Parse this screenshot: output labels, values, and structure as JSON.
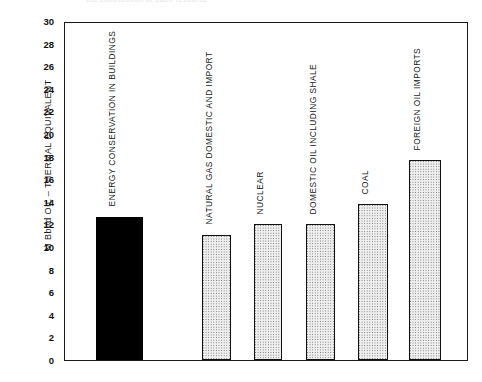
{
  "top_caption": "the contribution of each resource",
  "chart_data": {
    "type": "bar",
    "title": "",
    "subtitle": "",
    "xlabel": "",
    "ylabel": "M Bbl/d OIL – THERMAL EQUIVALENT",
    "ylim": [
      0,
      30
    ],
    "ytick_step": 2,
    "yticks": [
      30,
      28,
      26,
      24,
      22,
      20,
      18,
      16,
      14,
      12,
      10,
      8,
      6,
      4,
      2,
      0
    ],
    "grid": false,
    "legend": "none",
    "categories": [
      "ENERGY CONSERVATION IN BUILDINGS",
      "NATURAL GAS DOMESTIC AND IMPORT",
      "NUCLEAR",
      "DOMESTIC OIL INCLUDING SHALE",
      "COAL",
      "FOREIGN OIL IMPORTS"
    ],
    "values": [
      12.7,
      11.1,
      12.0,
      12.0,
      13.8,
      17.7
    ],
    "bars": [
      {
        "label": "ENERGY CONSERVATION IN BUILDINGS",
        "value": 12.7,
        "fill": "solid",
        "color": "#000000"
      },
      {
        "label": "NATURAL GAS DOMESTIC AND IMPORT",
        "value": 11.1,
        "fill": "dotted",
        "color": "#eeeeee"
      },
      {
        "label": "NUCLEAR",
        "value": 12.0,
        "fill": "dotted",
        "color": "#eeeeee"
      },
      {
        "label": "DOMESTIC OIL INCLUDING SHALE",
        "value": 12.0,
        "fill": "dotted",
        "color": "#eeeeee"
      },
      {
        "label": "COAL",
        "value": 13.8,
        "fill": "dotted",
        "color": "#eeeeee"
      },
      {
        "label": "FOREIGN OIL IMPORTS",
        "value": 17.7,
        "fill": "dotted",
        "color": "#eeeeee"
      }
    ]
  }
}
